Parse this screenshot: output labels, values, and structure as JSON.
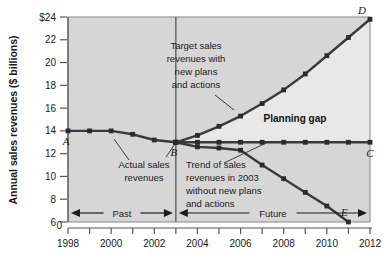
{
  "chart_data": {
    "type": "line",
    "title": "",
    "xlabel": "",
    "ylabel": "Annual sales revenues ($ billions)",
    "ylim": [
      6,
      24
    ],
    "y_axis_break": true,
    "y_break_label": "0",
    "y_ticks": [
      6,
      8,
      10,
      12,
      14,
      16,
      18,
      20,
      22,
      24
    ],
    "y_tick_labels": [
      "6",
      "8",
      "10",
      "12",
      "14",
      "16",
      "18",
      "20",
      "22",
      "$24"
    ],
    "xlim": [
      1998,
      2012
    ],
    "x_ticks": [
      1998,
      1999,
      2000,
      2001,
      2002,
      2003,
      2004,
      2005,
      2006,
      2007,
      2008,
      2009,
      2010,
      2011,
      2012
    ],
    "x_tick_labels": [
      "1998",
      "",
      "2000",
      "",
      "2002",
      "",
      "2004",
      "",
      "2006",
      "",
      "2008",
      "",
      "2010",
      "",
      "2012"
    ],
    "grid": false,
    "legend": "none",
    "divider_year": 2003,
    "series": [
      {
        "name": "Actual sales revenues",
        "x": [
          1998,
          1999,
          2000,
          2001,
          2002,
          2003
        ],
        "values": [
          14.0,
          14.0,
          14.0,
          13.7,
          13.2,
          13.0
        ]
      },
      {
        "name": "Target sales revenues with new plans and actions",
        "x": [
          2003,
          2004,
          2005,
          2006,
          2007,
          2008,
          2009,
          2010,
          2011,
          2012
        ],
        "values": [
          13.0,
          13.6,
          14.4,
          15.3,
          16.4,
          17.6,
          19.0,
          20.6,
          22.2,
          23.8
        ]
      },
      {
        "name": "Flat projection to C",
        "x": [
          2003,
          2004,
          2005,
          2006,
          2007,
          2008,
          2009,
          2010,
          2011,
          2012
        ],
        "values": [
          13.0,
          13.0,
          13.0,
          13.0,
          13.0,
          13.0,
          13.0,
          13.0,
          13.0,
          13.0
        ]
      },
      {
        "name": "Trend of sales revenues in 2003 without new plans and actions",
        "x": [
          2003,
          2004,
          2005,
          2006,
          2007,
          2008,
          2009,
          2010,
          2011
        ],
        "values": [
          13.0,
          12.6,
          12.5,
          12.3,
          11.0,
          9.8,
          8.6,
          7.4,
          6.0
        ]
      }
    ],
    "point_labels": [
      {
        "id": "A",
        "x": 1998,
        "y": 14.0
      },
      {
        "id": "B",
        "x": 2003,
        "y": 13.0
      },
      {
        "id": "C",
        "x": 2012,
        "y": 13.0
      },
      {
        "id": "D",
        "x": 2012,
        "y": 23.8
      },
      {
        "id": "E",
        "x": 2011,
        "y": 6.0
      }
    ],
    "annotations": [
      {
        "id": "target-label",
        "text": [
          "Target sales",
          "revenues with",
          "new plans",
          "and actions"
        ]
      },
      {
        "id": "planning-gap",
        "text": "Planning gap"
      },
      {
        "id": "actual-label",
        "text": [
          "Actual sales",
          "revenues"
        ]
      },
      {
        "id": "trend-label",
        "text": [
          "Trend of sales",
          "revenues in 2003",
          "without new plans",
          "and actions"
        ]
      }
    ],
    "era_labels": [
      {
        "id": "past",
        "text": "Past",
        "from": 1998,
        "to": 2003
      },
      {
        "id": "future",
        "text": "Future",
        "from": 2003,
        "to": 2012
      }
    ],
    "colors": {
      "plot_background": "#d6d6d6",
      "gap_background": "#e8e8e8",
      "line": "#3a3a3a",
      "marker": "#2b2b2b",
      "text": "#1a1a1a",
      "axis": "#555555"
    }
  }
}
